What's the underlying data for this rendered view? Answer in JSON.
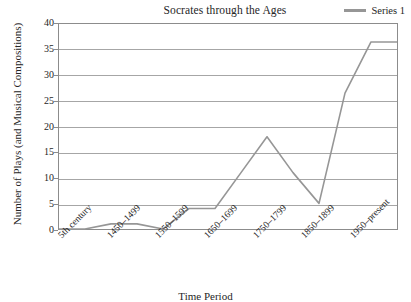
{
  "chart_data": {
    "type": "line",
    "title": "Socrates through the Ages",
    "xlabel": "Time Period",
    "ylabel": "Number of Plays (and Musical Compositions)",
    "ylim": [
      0,
      40
    ],
    "ytick_step": 5,
    "yticks": [
      "40",
      "35",
      "30",
      "25",
      "20",
      "15",
      "10",
      "5",
      "0"
    ],
    "grid": true,
    "legend_position": "top-right",
    "series": [
      {
        "name": "Series 1",
        "color": "#969696",
        "categories": [
          "5th century",
          "1400-1449",
          "1450-1499",
          "1500-1549",
          "1550-1599",
          "1600-1649",
          "1650-1699",
          "1700-1749",
          "1750-1799",
          "1800-1849",
          "1850-1899",
          "1900-1949",
          "1950-present",
          "after"
        ],
        "values": [
          0,
          0,
          1,
          1,
          0,
          4,
          4,
          11,
          18,
          11,
          5,
          26.5,
          36.5,
          36.5
        ]
      }
    ],
    "xtick_labels": [
      "5th century",
      "1450–1499",
      "1550–1599",
      "1650–1699",
      "1750–1799",
      "1850–1899",
      "1950–present"
    ]
  },
  "legend": {
    "series_label": "Series 1"
  }
}
